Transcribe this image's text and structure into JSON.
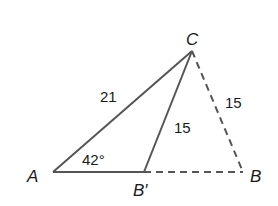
{
  "diagram": {
    "vertices": {
      "A": "A",
      "B": "B",
      "B_prime": "B′",
      "C": "C"
    },
    "side_labels": {
      "AC": "21",
      "CB_prime": "15",
      "CB": "15"
    },
    "angle_label": "42°",
    "colors": {
      "stroke": "#555555",
      "text": "#1a1a1a"
    }
  }
}
